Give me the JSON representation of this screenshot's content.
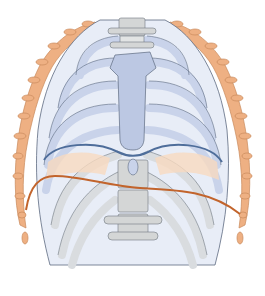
{
  "figure": {
    "colors": {
      "background": "#ffffff",
      "rib_upper": "#c9d3ea",
      "rib_upper_inner": "#e8edf7",
      "rib_lower": "#d9dcdf",
      "rib_lower_inner": "#f0f1f2",
      "outline": "#5d6a80",
      "sternum": "#bcc8e3",
      "vertebra": "#d4d6d6",
      "expanded_ribs": "#e9a877",
      "expanded_ribs_light": "#f7d9bf",
      "diaphragm_blue": "#4e6d9a",
      "diaphragm_orange": "#c2642c"
    },
    "lines": [
      {
        "name": "diaphragm-relaxed",
        "color": "#4e6d9a"
      },
      {
        "name": "diaphragm-contracted",
        "color": "#c2642c"
      }
    ]
  }
}
